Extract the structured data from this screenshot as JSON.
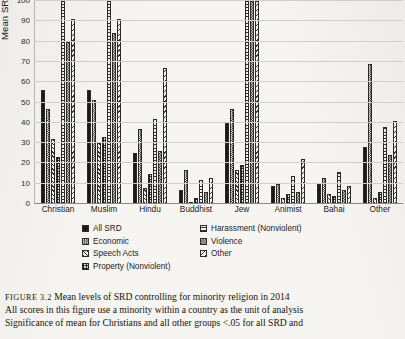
{
  "figure": {
    "number_label": "FIGURE 3.2",
    "title": "Mean levels of SRD controlling for minority religion in 2014",
    "note_line_1": "All scores in this figure use a minority within a country as the unit of analysis",
    "note_line_2": "Significance of mean for Christians and all other groups <.05 for all SRD and"
  },
  "axis": {
    "ylabel_line_1": "Mean SRD as % of highest scoring group",
    "ticks": [
      "100",
      "90",
      "80",
      "70",
      "60",
      "50",
      "40",
      "30",
      "20",
      "10",
      "0"
    ]
  },
  "legend": {
    "items": [
      {
        "label": "All SRD",
        "swatch": "solid-black-swatch"
      },
      {
        "label": "Harassment (Nonviolent)",
        "swatch": "horizontal-hatch-swatch"
      },
      {
        "label": "Economic",
        "swatch": "checker-swatch"
      },
      {
        "label": "Violence",
        "swatch": "fine-checker-swatch"
      },
      {
        "label": "Speech Acts",
        "swatch": "diagonal-hatch-swatch"
      },
      {
        "label": "Other",
        "swatch": "back-diagonal-hatch-swatch"
      },
      {
        "label": "Property (Nonviolent)",
        "swatch": "grid-hatch-swatch"
      }
    ]
  },
  "chart_data": {
    "type": "bar",
    "title": "Mean levels of SRD controlling for minority religion in 2014",
    "xlabel": "",
    "ylabel": "Mean SRD as % of highest scoring group",
    "ylim": [
      0,
      100
    ],
    "grid": true,
    "legend_position": "below-plot",
    "categories": [
      "Christian",
      "Muslim",
      "Hindu",
      "Buddhist",
      "Jew",
      "Animist",
      "Bahai",
      "Other"
    ],
    "series": [
      {
        "name": "All SRD",
        "values": [
          56,
          56,
          25,
          7,
          40,
          9,
          10,
          28
        ]
      },
      {
        "name": "Economic",
        "values": [
          47,
          51,
          37,
          17,
          47,
          10,
          13,
          69
        ]
      },
      {
        "name": "Speech Acts",
        "values": [
          32,
          30,
          8,
          1,
          17,
          3,
          5,
          3
        ]
      },
      {
        "name": "Property (Nonviolent)",
        "values": [
          23,
          33,
          15,
          3,
          19,
          5,
          4,
          6
        ]
      },
      {
        "name": "Harassment (Nonviolent)",
        "values": [
          100,
          100,
          42,
          12,
          100,
          14,
          16,
          38
        ]
      },
      {
        "name": "Violence",
        "values": [
          80,
          84,
          26,
          6,
          100,
          6,
          7,
          24
        ]
      },
      {
        "name": "Other",
        "values": [
          91,
          91,
          67,
          13,
          100,
          22,
          9,
          41
        ]
      }
    ]
  }
}
